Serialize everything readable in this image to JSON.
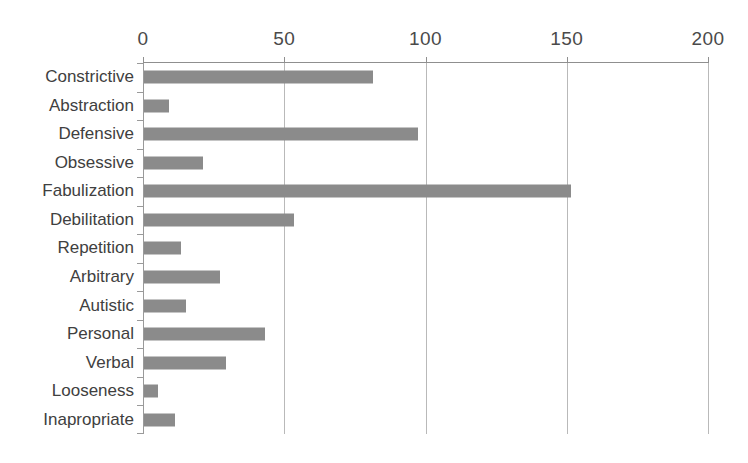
{
  "chart_data": {
    "type": "bar",
    "orientation": "horizontal",
    "title": "",
    "xlabel": "",
    "ylabel": "",
    "xlim": [
      0,
      200
    ],
    "ylim": null,
    "grid": true,
    "legend": null,
    "xticks": [
      0,
      50,
      100,
      150,
      200
    ],
    "xtick_labels": [
      "0",
      "50",
      "100",
      "150",
      "200"
    ],
    "categories": [
      "Constrictive",
      "Abstraction",
      "Defensive",
      "Obsessive",
      "Fabulization",
      "Debilitation",
      "Repetition",
      "Arbitrary",
      "Autistic",
      "Personal",
      "Verbal",
      "Looseness",
      "Inapropriate"
    ],
    "values": [
      81,
      9,
      97,
      21,
      151,
      53,
      13,
      27,
      15,
      43,
      29,
      5,
      11
    ],
    "series": [
      {
        "name": "",
        "values": [
          81,
          9,
          97,
          21,
          151,
          53,
          13,
          27,
          15,
          43,
          29,
          5,
          11
        ]
      }
    ],
    "bar_color": "#8b8b8b",
    "grid_color": "#b9b9b9",
    "axis_color": "#8f8f8f",
    "text_color": "#404040",
    "background": "#ffffff"
  },
  "caption": ""
}
